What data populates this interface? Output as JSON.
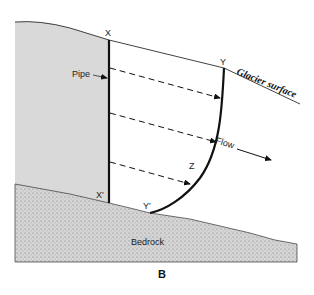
{
  "figure": {
    "panel_label": "B",
    "labels": {
      "top_of_pipe": "X",
      "bottom_of_pipe": "X'",
      "surface_point": "Y",
      "bed_point": "Y'",
      "mid_point": "Z",
      "pipe": "Pipe",
      "glacier_surface": "Glacier surface",
      "flow": "Flow",
      "bedrock": "Bedrock"
    },
    "colors": {
      "ice": "#d9d9d9",
      "bedrock": "#cfcfcf",
      "line": "#111111"
    }
  }
}
